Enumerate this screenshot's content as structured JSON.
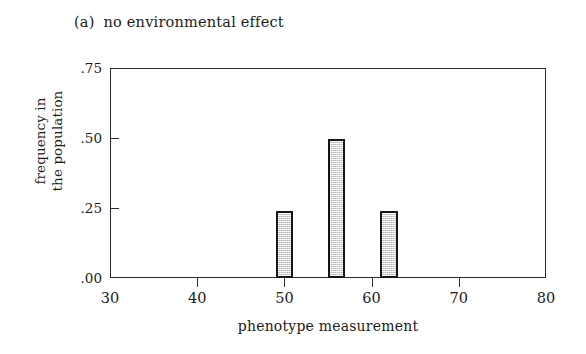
{
  "figure": {
    "index_label": "(a)",
    "caption": "no environmental effect"
  },
  "chart_data": {
    "type": "bar",
    "xlabel": "phenotype measurement",
    "ylabel": "frequency in the population",
    "ylabel_lines": [
      "frequency in",
      "the population"
    ],
    "xlim": [
      30,
      80
    ],
    "ylim": [
      0.0,
      0.75
    ],
    "xticks": [
      30,
      40,
      50,
      60,
      70,
      80
    ],
    "xtick_labels": [
      "30",
      "40",
      "50",
      "60",
      "70",
      "80"
    ],
    "yticks": [
      0.0,
      0.25,
      0.5,
      0.75
    ],
    "ytick_labels": [
      ".00",
      ".25",
      ".50",
      ".75"
    ],
    "grid": false,
    "legend": false,
    "bar_width": 2,
    "bar_fill_color": "#dcdcdc",
    "bar_edge_color": "#161616",
    "x": [
      50,
      56,
      62
    ],
    "values": [
      0.24,
      0.495,
      0.24
    ],
    "bars": [
      {
        "x": 50,
        "value": 0.24
      },
      {
        "x": 56,
        "value": 0.495
      },
      {
        "x": 62,
        "value": 0.24
      }
    ]
  }
}
